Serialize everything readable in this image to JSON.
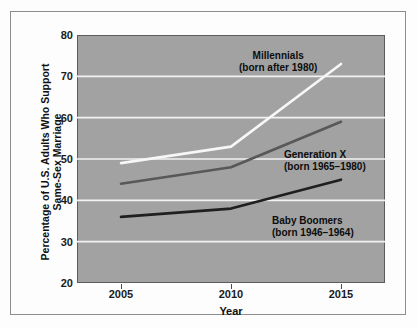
{
  "chart_data": {
    "type": "line",
    "title": "",
    "xlabel": "Year",
    "ylabel": "Percentage of U.S. Adults Who Support Same-Sex Marriage",
    "ylabel_line1": "Percentage of U.S. Adults Who Support",
    "ylabel_line2": "Same-Sex Marriage",
    "x": [
      2005,
      2010,
      2015
    ],
    "xticks": [
      "2005",
      "2010",
      "2015"
    ],
    "yticks": [
      "20",
      "30",
      "40",
      "50",
      "60",
      "70",
      "80"
    ],
    "xlim": [
      2003,
      2017
    ],
    "ylim": [
      20,
      80
    ],
    "gridlines": [
      30,
      40,
      50,
      60,
      70
    ],
    "grid": true,
    "legend_position": "inline-annotations",
    "plot_background": "#a2a2a2",
    "gridline_color": "#f2f2f2",
    "series": [
      {
        "name": "Millennials",
        "sublabel": "(born after 1980)",
        "values": [
          49,
          53,
          73
        ],
        "color": "#f7f7f7"
      },
      {
        "name": "Generation X",
        "sublabel": "(born 1965–1980)",
        "values": [
          44,
          48,
          59
        ],
        "color": "#585858"
      },
      {
        "name": "Baby Boomers",
        "sublabel": "(born 1946–1964)",
        "values": [
          36,
          38,
          45
        ],
        "color": "#1f1f1f"
      }
    ]
  },
  "axes": {
    "x_title": "Year",
    "y_title_line1": "Percentage of U.S. Adults Who Support",
    "y_title_line2": "Same-Sex Marriage",
    "yticks": {
      "t20": "20",
      "t30": "30",
      "t40": "40",
      "t50": "50",
      "t60": "60",
      "t70": "70",
      "t80": "80"
    },
    "xticks": {
      "t2005": "2005",
      "t2010": "2010",
      "t2015": "2015"
    }
  },
  "annotations": {
    "millennials": {
      "name": "Millennials",
      "sub": "(born after 1980)"
    },
    "genx": {
      "name": "Generation X",
      "sub": "(born 1965–1980)"
    },
    "boomers": {
      "name": "Baby Boomers",
      "sub": "(born 1946–1964)"
    }
  }
}
